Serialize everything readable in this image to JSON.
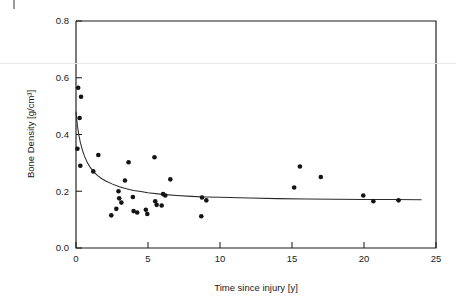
{
  "chart_data": {
    "type": "scatter",
    "title": "",
    "subtitle": "",
    "xlabel": "Time since injury [y]",
    "ylabel": "Bone Density [g/cm³]",
    "xlim": [
      0,
      25
    ],
    "ylim": [
      0.0,
      0.8
    ],
    "xticks": [
      "0",
      "5",
      "10",
      "15",
      "20",
      "25"
    ],
    "xtick_values": [
      0,
      5,
      10,
      15,
      20,
      25
    ],
    "yticks": [
      "0.0",
      "0.2",
      "0.4",
      "0.6",
      "0.8"
    ],
    "ytick_values": [
      0.0,
      0.2,
      0.4,
      0.6,
      0.8
    ],
    "grid": false,
    "legend": "none",
    "marker": "filled-circle",
    "marker_color": "#141414",
    "series": [
      {
        "name": "Bone density measurements",
        "type": "scatter",
        "points": [
          [
            0.15,
            0.565
          ],
          [
            0.35,
            0.533
          ],
          [
            0.25,
            0.458
          ],
          [
            0.1,
            0.35
          ],
          [
            0.3,
            0.29
          ],
          [
            1.2,
            0.27
          ],
          [
            1.55,
            0.328
          ],
          [
            2.45,
            0.115
          ],
          [
            2.8,
            0.138
          ],
          [
            2.95,
            0.2
          ],
          [
            3.0,
            0.175
          ],
          [
            3.15,
            0.16
          ],
          [
            3.4,
            0.238
          ],
          [
            3.65,
            0.302
          ],
          [
            3.95,
            0.18
          ],
          [
            4.0,
            0.13
          ],
          [
            4.25,
            0.125
          ],
          [
            4.85,
            0.135
          ],
          [
            4.95,
            0.12
          ],
          [
            5.45,
            0.32
          ],
          [
            5.5,
            0.165
          ],
          [
            5.6,
            0.152
          ],
          [
            5.95,
            0.15
          ],
          [
            6.05,
            0.19
          ],
          [
            6.2,
            0.185
          ],
          [
            6.55,
            0.242
          ],
          [
            8.7,
            0.112
          ],
          [
            8.75,
            0.178
          ],
          [
            9.05,
            0.168
          ],
          [
            15.15,
            0.213
          ],
          [
            15.55,
            0.287
          ],
          [
            17.0,
            0.25
          ],
          [
            19.95,
            0.185
          ],
          [
            20.65,
            0.165
          ],
          [
            22.4,
            0.168
          ]
        ]
      },
      {
        "name": "Fitted decay curve",
        "type": "line",
        "model": "exponential-decay-to-asymptote",
        "asymptote": 0.17,
        "points": [
          [
            0.0,
            0.48
          ],
          [
            0.1,
            0.43
          ],
          [
            0.2,
            0.398
          ],
          [
            0.3,
            0.372
          ],
          [
            0.45,
            0.344
          ],
          [
            0.6,
            0.322
          ],
          [
            0.8,
            0.3
          ],
          [
            1.0,
            0.283
          ],
          [
            1.25,
            0.267
          ],
          [
            1.5,
            0.255
          ],
          [
            1.8,
            0.244
          ],
          [
            2.1,
            0.235
          ],
          [
            2.5,
            0.226
          ],
          [
            3.0,
            0.216
          ],
          [
            3.5,
            0.209
          ],
          [
            4.0,
            0.203
          ],
          [
            4.5,
            0.199
          ],
          [
            5.0,
            0.195
          ],
          [
            6.0,
            0.189
          ],
          [
            7.0,
            0.185
          ],
          [
            8.0,
            0.182
          ],
          [
            9.0,
            0.18
          ],
          [
            10.0,
            0.179
          ],
          [
            12.0,
            0.176
          ],
          [
            14.0,
            0.174
          ],
          [
            16.0,
            0.173
          ],
          [
            18.0,
            0.172
          ],
          [
            20.0,
            0.171
          ],
          [
            22.0,
            0.171
          ],
          [
            24.0,
            0.17
          ]
        ]
      }
    ]
  },
  "axes": {
    "x_axis_name": "Time since injury [y]",
    "y_axis_name": "Bone Density [g/cm³]"
  },
  "colors": {
    "marker": "#141414",
    "curve": "#2a2a2a",
    "axis": "#1d1d1d",
    "background": "#ffffff",
    "scan_artifact": "#e9e9e9"
  }
}
